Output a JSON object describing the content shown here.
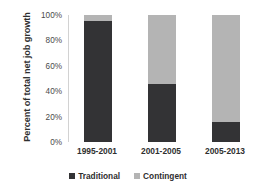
{
  "chart_data": {
    "type": "bar",
    "subtype": "stacked-100-percent",
    "title": "",
    "xlabel": "",
    "ylabel": "Percent of total net job growth",
    "categories": [
      "1995-2001",
      "2001-2005",
      "2005-2013"
    ],
    "series": [
      {
        "name": "Traditional",
        "color": "#333335",
        "values": [
          95,
          46,
          16
        ]
      },
      {
        "name": "Contingent",
        "color": "#b4b4b4",
        "values": [
          5,
          54,
          84
        ]
      }
    ],
    "ylim": [
      0,
      100
    ],
    "yticks": [
      "0%",
      "20%",
      "40%",
      "60%",
      "80%",
      "100%"
    ],
    "ytick_values": [
      0,
      20,
      40,
      60,
      80,
      100
    ],
    "grid": false,
    "legend_position": "bottom"
  },
  "axis": {
    "y_title": "Percent of total net job growth"
  },
  "legend": {
    "entries": [
      {
        "label": "Traditional",
        "color": "#333335"
      },
      {
        "label": "Contingent",
        "color": "#b4b4b4"
      }
    ]
  }
}
